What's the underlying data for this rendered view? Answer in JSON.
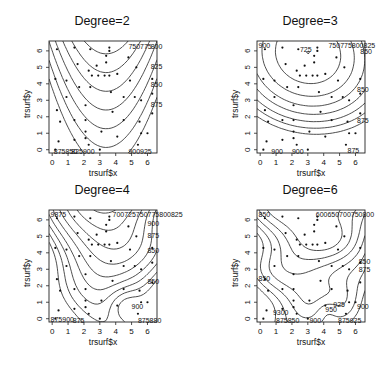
{
  "chart_data": [
    {
      "type": "contour",
      "title": "Degree=2",
      "xlabel": "trsurf$x",
      "ylabel": "trsurf$y",
      "xticks": [
        0,
        1,
        2,
        3,
        4,
        5,
        6
      ],
      "yticks": [
        0,
        1,
        2,
        3,
        4,
        5,
        6
      ],
      "xlim": [
        -0.2,
        6.6
      ],
      "ylim": [
        -0.2,
        6.6
      ],
      "contour_labels": [
        "750",
        "775",
        "800",
        "825",
        "850",
        "875",
        "900",
        "925"
      ],
      "visible_label_text": [
        "750775800",
        "825",
        "850",
        "875",
        "875850825900",
        "900925"
      ]
    },
    {
      "type": "contour",
      "title": "Degree=3",
      "xlabel": "trsurf$x",
      "ylabel": "trsurf$y",
      "xticks": [
        0,
        1,
        2,
        3,
        4,
        5,
        6
      ],
      "yticks": [
        0,
        1,
        2,
        3,
        4,
        5,
        6
      ],
      "xlim": [
        -0.2,
        6.6
      ],
      "ylim": [
        -0.2,
        6.6
      ],
      "contour_labels": [
        "725",
        "750",
        "775",
        "800",
        "825",
        "850",
        "875",
        "900"
      ],
      "visible_label_text": [
        "900",
        "725",
        "750775800825850",
        "850",
        "875",
        "900",
        "900",
        "875"
      ]
    },
    {
      "type": "contour",
      "title": "Degree=4",
      "xlabel": "trsurf$x",
      "ylabel": "trsurf$y",
      "xticks": [
        0,
        1,
        2,
        3,
        4,
        5,
        6
      ],
      "yticks": [
        0,
        1,
        2,
        3,
        4,
        5,
        6
      ],
      "xlim": [
        -0.2,
        6.6
      ],
      "ylim": [
        -0.2,
        6.6
      ],
      "contour_labels": [
        "700",
        "725",
        "750",
        "775",
        "800",
        "825",
        "850",
        "875",
        "900",
        "925"
      ],
      "visible_label_text": [
        "9875",
        "700725750775800825",
        "900",
        "875",
        "850",
        "850",
        "900",
        "875900",
        "875",
        "875880"
      ]
    },
    {
      "type": "contour",
      "title": "Degree=6",
      "xlabel": "trsurf$x",
      "ylabel": "trsurf$y",
      "xticks": [
        0,
        1,
        2,
        3,
        4,
        5,
        6
      ],
      "yticks": [
        0,
        1,
        2,
        3,
        4,
        5,
        6
      ],
      "xlim": [
        -0.2,
        6.6
      ],
      "ylim": [
        -0.2,
        6.6
      ],
      "contour_labels": [
        "800",
        "825",
        "850",
        "875",
        "900",
        "925",
        "950"
      ],
      "visible_label_text": [
        "850",
        "600650700750800",
        "850",
        "875",
        "850",
        "925",
        "950",
        "900",
        "900",
        "875",
        "900"
      ]
    }
  ],
  "points": [
    [
      0.3,
      6.1
    ],
    [
      1.4,
      6.2
    ],
    [
      2.4,
      6.1
    ],
    [
      3.6,
      6.2
    ],
    [
      3.6,
      6.0
    ],
    [
      3.4,
      5.7
    ],
    [
      3.4,
      5.3
    ],
    [
      1.6,
      5.2
    ],
    [
      2.8,
      5.1
    ],
    [
      4.8,
      5.6
    ],
    [
      5.3,
      5.0
    ],
    [
      2.3,
      4.8
    ],
    [
      2.5,
      4.5
    ],
    [
      2.9,
      4.5
    ],
    [
      3.3,
      4.5
    ],
    [
      3.6,
      4.5
    ],
    [
      4.1,
      4.6
    ],
    [
      0.2,
      4.3
    ],
    [
      0.9,
      4.2
    ],
    [
      4.9,
      4.2
    ],
    [
      6.3,
      4.3
    ],
    [
      1.7,
      3.8
    ],
    [
      2.4,
      3.8
    ],
    [
      3.7,
      3.5
    ],
    [
      0.9,
      3.2
    ],
    [
      4.5,
      3.2
    ],
    [
      5.2,
      3.2
    ],
    [
      5.6,
      3.0
    ],
    [
      6.3,
      3.4
    ],
    [
      2.1,
      2.7
    ],
    [
      0.3,
      2.4
    ],
    [
      3.8,
      2.3
    ],
    [
      6.3,
      2.2
    ],
    [
      0.5,
      1.7
    ],
    [
      1.4,
      1.8
    ],
    [
      2.1,
      1.8
    ],
    [
      4.5,
      1.8
    ],
    [
      5.5,
      1.7
    ],
    [
      2.1,
      1.1
    ],
    [
      3.1,
      1.1
    ],
    [
      6.0,
      1.0
    ],
    [
      5.6,
      1.0
    ],
    [
      2.1,
      0.7
    ],
    [
      4.1,
      0.8
    ],
    [
      0.4,
      0.5
    ],
    [
      1.4,
      0.6
    ],
    [
      5.4,
      0.3
    ],
    [
      2.3,
      0.3
    ],
    [
      3.0,
      0.0
    ],
    [
      0.2,
      0.0
    ]
  ],
  "contours": [
    {
      "labels": [
        {
          "text": "750775",
          "x": 4.8,
          "y": 6.3
        },
        {
          "text": "800",
          "x": 6.2,
          "y": 6.3
        },
        {
          "text": "825",
          "x": 6.2,
          "y": 5.1
        },
        {
          "text": "850",
          "x": 6.2,
          "y": 4.0
        },
        {
          "text": "875",
          "x": 6.2,
          "y": 2.8
        },
        {
          "text": "875850",
          "x": 0.1,
          "y": -0.1
        },
        {
          "text": "825900",
          "x": 1.2,
          "y": -0.1
        },
        {
          "text": "900925",
          "x": 4.8,
          "y": -0.1
        }
      ]
    },
    {
      "labels": [
        {
          "text": "900",
          "x": -0.1,
          "y": 6.35
        },
        {
          "text": "725",
          "x": 2.5,
          "y": 6.1
        },
        {
          "text": "750775800825",
          "x": 4.3,
          "y": 6.35
        },
        {
          "text": "850",
          "x": 6.3,
          "y": 6.0
        },
        {
          "text": "850",
          "x": 6.1,
          "y": 3.7
        },
        {
          "text": "875",
          "x": 6.1,
          "y": 1.8
        },
        {
          "text": "900",
          "x": 0.7,
          "y": -0.1
        },
        {
          "text": "900",
          "x": 2.0,
          "y": -0.1
        },
        {
          "text": "875",
          "x": 5.5,
          "y": -0.0
        }
      ]
    },
    {
      "labels": [
        {
          "text": "9875",
          "x": -0.1,
          "y": 6.35
        },
        {
          "text": "700725750775800825",
          "x": 3.8,
          "y": 6.35
        },
        {
          "text": "900",
          "x": 6.0,
          "y": 5.8
        },
        {
          "text": "875",
          "x": 6.0,
          "y": 5.1
        },
        {
          "text": "850",
          "x": 6.0,
          "y": 4.2
        },
        {
          "text": "850",
          "x": 6.0,
          "y": 2.3
        },
        {
          "text": "900",
          "x": 5.0,
          "y": 0.8
        },
        {
          "text": "875900",
          "x": -0.1,
          "y": 0.0
        },
        {
          "text": "875",
          "x": 1.3,
          "y": -0.1
        },
        {
          "text": "875880",
          "x": 5.4,
          "y": -0.1
        }
      ]
    },
    {
      "labels": [
        {
          "text": "850",
          "x": -0.1,
          "y": 6.35
        },
        {
          "text": "600650700750800",
          "x": 3.5,
          "y": 6.35
        },
        {
          "text": "850",
          "x": 6.2,
          "y": 3.5
        },
        {
          "text": "875",
          "x": 6.2,
          "y": 3.0
        },
        {
          "text": "850",
          "x": -0.1,
          "y": 2.5
        },
        {
          "text": "925",
          "x": 4.6,
          "y": 0.9
        },
        {
          "text": "950",
          "x": 4.1,
          "y": 0.6
        },
        {
          "text": "900",
          "x": 6.1,
          "y": 0.8
        },
        {
          "text": "9300",
          "x": 0.8,
          "y": 0.4
        },
        {
          "text": "875850",
          "x": 1.0,
          "y": -0.1
        },
        {
          "text": "900",
          "x": 3.1,
          "y": -0.1
        },
        {
          "text": "875925",
          "x": 4.9,
          "y": -0.1
        }
      ]
    }
  ]
}
